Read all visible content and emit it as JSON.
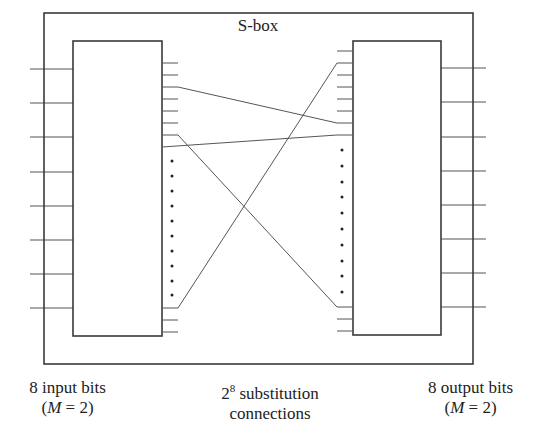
{
  "title": "S-box",
  "colors": {
    "stroke": "#3a3a3a",
    "wire": "#555555",
    "background": "#ffffff"
  },
  "labels": {
    "input": {
      "line1": "8 input bits",
      "line2_pre": "(",
      "line2_var": "M",
      "line2_post": " = 2)"
    },
    "middle": {
      "base": "2",
      "exponent": "8",
      "line1_rest": " substitution",
      "line2": "connections"
    },
    "output": {
      "line1": "8 output bits",
      "line2_pre": "(",
      "line2_var": "M",
      "line2_post": " = 2)"
    }
  },
  "geometry": {
    "outer_box": {
      "x": 44,
      "y": 13,
      "w": 429,
      "h": 351
    },
    "left_box": {
      "x": 73,
      "y": 41,
      "w": 89,
      "h": 295
    },
    "right_box": {
      "x": 353,
      "y": 41,
      "w": 88,
      "h": 294
    },
    "input_lines_y": [
      69,
      103,
      137,
      172,
      206,
      240,
      274,
      308
    ],
    "output_lines_y": [
      68,
      102,
      137,
      171,
      205,
      239,
      273,
      307
    ],
    "left_stubs_y": [
      63,
      75,
      99,
      111,
      123,
      320,
      332
    ],
    "right_stubs_y": [
      51,
      75,
      87,
      99,
      111,
      319,
      331
    ],
    "left_dots_y": [
      161,
      176,
      191,
      206,
      221,
      236,
      251,
      266,
      281,
      295
    ],
    "right_dots_y": [
      150,
      166,
      182,
      197,
      213,
      229,
      245,
      261,
      276,
      292
    ],
    "connections": [
      {
        "name": "connection-a",
        "points": [
          [
            162,
            87
          ],
          [
            178,
            87
          ],
          [
            337,
            123
          ],
          [
            353,
            123
          ]
        ]
      },
      {
        "name": "connection-b",
        "points": [
          [
            162,
            135
          ],
          [
            178,
            135
          ],
          [
            337,
            307
          ],
          [
            353,
            307
          ]
        ]
      },
      {
        "name": "connection-c",
        "points": [
          [
            162,
            147
          ],
          [
            337,
            135
          ],
          [
            353,
            135
          ]
        ]
      },
      {
        "name": "connection-d",
        "points": [
          [
            162,
            308
          ],
          [
            178,
            308
          ],
          [
            337,
            63
          ],
          [
            353,
            63
          ]
        ]
      }
    ]
  }
}
